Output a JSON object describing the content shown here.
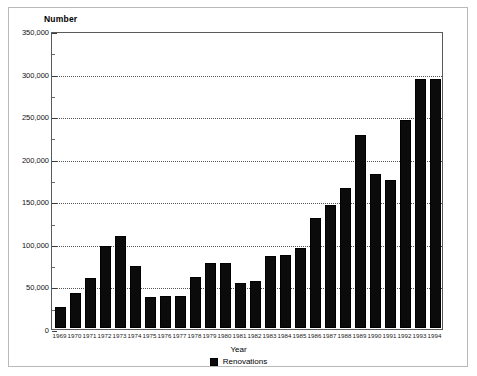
{
  "chart_data": {
    "type": "bar",
    "title": "",
    "ylabel": "Number",
    "xlabel": "Year",
    "ylim": [
      0,
      350000
    ],
    "ytick_step": 50000,
    "ytick_labels": [
      "350,000",
      "300,000",
      "250,000",
      "200,000",
      "150,000",
      "100,000",
      "50,000",
      "0"
    ],
    "ytick_values": [
      350000,
      300000,
      250000,
      200000,
      150000,
      100000,
      50000,
      0
    ],
    "grid": true,
    "grid_style": "dotted-horizontal",
    "legend": [
      "Renovations"
    ],
    "legend_position": "bottom-center",
    "bar_color": "#0b0b0b",
    "categories": [
      "1969",
      "1970",
      "1971",
      "1972",
      "1973",
      "1974",
      "1975",
      "1976",
      "1977",
      "1978",
      "1979",
      "1980",
      "1981",
      "1982",
      "1983",
      "1984",
      "1985",
      "1986",
      "1987",
      "1988",
      "1989",
      "1990",
      "1991",
      "1992",
      "1993",
      "1994"
    ],
    "series": [
      {
        "name": "Renovations",
        "values": [
          25000,
          41000,
          59000,
          97000,
          109000,
          73000,
          37000,
          38000,
          38000,
          60000,
          77000,
          77000,
          53000,
          56000,
          85000,
          86000,
          95000,
          130000,
          145000,
          165000,
          228000,
          182000,
          175000,
          246000,
          294000,
          294000
        ]
      }
    ]
  },
  "legend": {
    "renovations_label": "Renovations",
    "swatch_name": "bar-color-swatch"
  },
  "axis": {
    "y_title": "Number",
    "x_title": "Year"
  }
}
